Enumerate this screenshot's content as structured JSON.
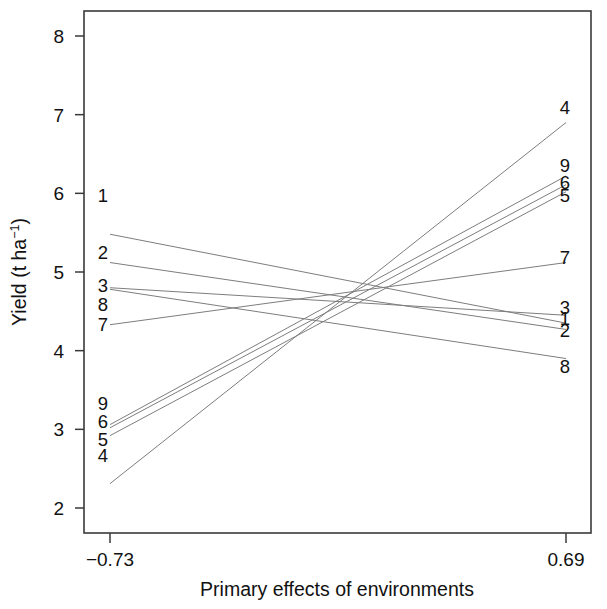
{
  "chart_data": {
    "type": "line",
    "title": "",
    "xlabel": "Primary effects of environments",
    "ylabel": "Yield (t ha-1)",
    "ylabel_parts": {
      "main": "Yield (t ha",
      "sup": "−1",
      "tail": ")"
    },
    "x": [
      -0.73,
      0.69
    ],
    "xlim": [
      -0.78,
      0.755
    ],
    "ylim": [
      1.67,
      8.31
    ],
    "xticks": [
      -0.73,
      0.69
    ],
    "xticklabels": [
      "−0.73",
      "0.69"
    ],
    "yticks": [
      2,
      3,
      4,
      5,
      6,
      7,
      8
    ],
    "yticklabels": [
      "2",
      "3",
      "4",
      "5",
      "6",
      "7",
      "8"
    ],
    "grid": false,
    "legend": "inline-endpoint-labels",
    "line_color": "#7d7d7d",
    "axis_color": "#3a3a3a",
    "convergence": {
      "x": 0.0,
      "y": 4.68
    },
    "series": [
      {
        "name": "1",
        "label": "1",
        "values": [
          5.48,
          4.35
        ],
        "left_label_y": 5.98,
        "right_label_y": 4.42
      },
      {
        "name": "2",
        "label": "2",
        "values": [
          5.12,
          4.27
        ],
        "left_label_y": 5.26,
        "right_label_y": 4.26
      },
      {
        "name": "3",
        "label": "3",
        "values": [
          4.8,
          4.45
        ],
        "left_label_y": 4.83,
        "right_label_y": 4.56
      },
      {
        "name": "4",
        "label": "4",
        "values": [
          2.31,
          6.9
        ],
        "left_label_y": 2.67,
        "right_label_y": 7.1
      },
      {
        "name": "5",
        "label": "5",
        "values": [
          2.92,
          6.02
        ],
        "left_label_y": 2.88,
        "right_label_y": 5.98
      },
      {
        "name": "6",
        "label": "6",
        "values": [
          3.02,
          6.11
        ],
        "left_label_y": 3.1,
        "right_label_y": 6.14
      },
      {
        "name": "7",
        "label": "7",
        "values": [
          4.33,
          5.12
        ],
        "left_label_y": 4.34,
        "right_label_y": 5.19
      },
      {
        "name": "8",
        "label": "8",
        "values": [
          4.78,
          3.9
        ],
        "left_label_y": 4.59,
        "right_label_y": 3.8
      },
      {
        "name": "9",
        "label": "9",
        "values": [
          3.06,
          6.22
        ],
        "left_label_y": 3.34,
        "right_label_y": 6.36
      }
    ]
  },
  "labels": {
    "x_axis_title": "Primary effects of environments",
    "y_axis_title": "Yield (t ha−1)",
    "x_tick_left": "−0.73",
    "x_tick_right": "0.69"
  }
}
